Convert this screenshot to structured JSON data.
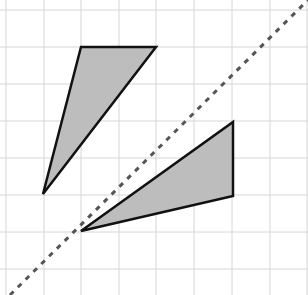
{
  "diagram": {
    "type": "reflection-on-grid",
    "background": "#ffffff",
    "grid": {
      "color": "#d6d6d6",
      "vertical_x": [
        6,
        44,
        81,
        119,
        156,
        194,
        232,
        270,
        307
      ],
      "horizontal_y": [
        10,
        47,
        84,
        121,
        158,
        195,
        232,
        269
      ]
    },
    "shapes": [
      {
        "name": "original-triangle",
        "fill": "#bdbdbd",
        "stroke": "#111111",
        "points": [
          [
            81,
            47
          ],
          [
            156,
            47
          ],
          [
            43,
            194
          ]
        ]
      },
      {
        "name": "reflected-triangle",
        "fill": "#bdbdbd",
        "stroke": "#111111",
        "points": [
          [
            81,
            231
          ],
          [
            233,
            122
          ],
          [
            233,
            196
          ]
        ]
      }
    ],
    "mirror_line": {
      "style": "dashed",
      "color": "#555555",
      "from": [
        10,
        295
      ],
      "to": [
        308,
        0
      ]
    }
  }
}
